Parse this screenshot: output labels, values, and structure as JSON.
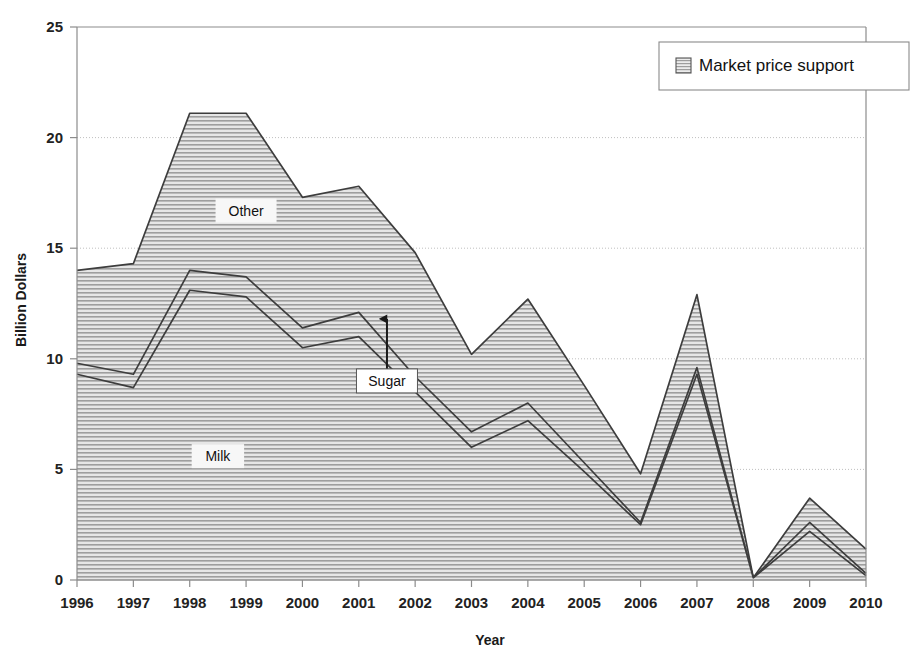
{
  "chart_data": {
    "type": "area",
    "stacked": true,
    "title": "",
    "xlabel": "Year",
    "ylabel": "Billion Dollars",
    "categories": [
      1996,
      1997,
      1998,
      1999,
      2000,
      2001,
      2002,
      2003,
      2004,
      2005,
      2006,
      2007,
      2008,
      2009,
      2010
    ],
    "x": [
      "1996",
      "1997",
      "1998",
      "1999",
      "2000",
      "2001",
      "2002",
      "2003",
      "2004",
      "2005",
      "2006",
      "2007",
      "2008",
      "2009",
      "2010"
    ],
    "xlim": [
      1996,
      2010
    ],
    "ylim": [
      0,
      25
    ],
    "yticks": [
      0,
      5,
      10,
      15,
      20,
      25
    ],
    "ytick_labels": [
      "0",
      "5",
      "10",
      "15",
      "20",
      "25"
    ],
    "grid": true,
    "grid_axis": "y",
    "legend": [
      "Market price support"
    ],
    "legend_position": "top-right",
    "series": [
      {
        "name": "Milk",
        "values": [
          9.3,
          8.7,
          13.1,
          12.8,
          10.5,
          11.0,
          8.5,
          6.0,
          7.2,
          4.9,
          2.5,
          9.3,
          0.1,
          2.2,
          0.2
        ]
      },
      {
        "name": "Sugar",
        "values": [
          0.5,
          0.6,
          0.9,
          0.9,
          0.9,
          1.1,
          0.7,
          0.7,
          0.8,
          0.4,
          0.1,
          0.3,
          0.0,
          0.4,
          0.1
        ]
      },
      {
        "name": "Other",
        "values": [
          4.2,
          5.0,
          7.1,
          7.4,
          5.9,
          5.7,
          5.6,
          3.5,
          4.7,
          3.5,
          2.2,
          3.3,
          0.0,
          1.1,
          1.1
        ]
      }
    ],
    "cumulative": {
      "milk_top": [
        9.3,
        8.7,
        13.1,
        12.8,
        10.5,
        11.0,
        8.5,
        6.0,
        7.2,
        4.9,
        2.5,
        9.3,
        0.1,
        2.2,
        0.2
      ],
      "sugar_top": [
        9.8,
        9.3,
        14.0,
        13.7,
        11.4,
        12.1,
        9.2,
        6.7,
        8.0,
        5.3,
        2.6,
        9.6,
        0.1,
        2.6,
        0.3
      ],
      "other_top": [
        14.0,
        14.3,
        21.1,
        21.1,
        17.3,
        17.8,
        14.8,
        10.2,
        12.7,
        8.8,
        4.8,
        12.9,
        0.1,
        3.7,
        1.4
      ]
    },
    "annotations": [
      {
        "label": "Other",
        "x_value": 1999.0,
        "y_value": 16.7,
        "callout": false
      },
      {
        "label": "Sugar",
        "x_value": 2001.5,
        "y_value": 9.0,
        "callout": true
      },
      {
        "label": "Milk",
        "x_value": 1998.5,
        "y_value": 5.6,
        "callout": false
      }
    ]
  },
  "legend": {
    "items": [
      {
        "label": "Market price support",
        "swatch": "hatched-square-icon"
      }
    ]
  },
  "axes": {
    "y_title": "Billion Dollars",
    "x_title": "Year"
  },
  "colors": {
    "fill": "#d9d9d9",
    "hatch_line": "#9a9a9a",
    "series_outline": "#3d3d3d",
    "axis_line": "#8c8c8c",
    "grid_line": "#bfbfbf",
    "text": "#1a1a1a",
    "background": "#ffffff"
  }
}
